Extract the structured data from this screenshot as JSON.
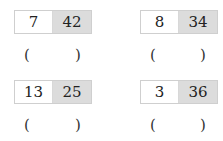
{
  "problems": [
    {
      "left": "7",
      "right": "42",
      "answer_open": "(",
      "answer_close": ")"
    },
    {
      "left": "8",
      "right": "34",
      "answer_open": "(",
      "answer_close": ")"
    },
    {
      "left": "13",
      "right": "25",
      "answer_open": "(",
      "answer_close": ")"
    },
    {
      "left": "3",
      "right": "36",
      "answer_open": "(",
      "answer_close": ")"
    }
  ],
  "colors": {
    "left_cell": "#ffffff",
    "right_cell": "#dcdcdc",
    "border": "#cfcfcf"
  }
}
